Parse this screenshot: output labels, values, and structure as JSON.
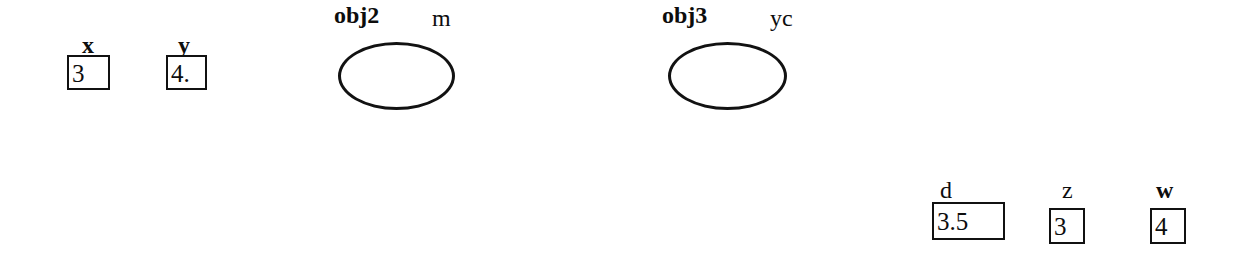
{
  "diagram": {
    "background_color": "#ffffff",
    "stroke_color": "#111111",
    "variables": [
      {
        "name": "x",
        "label": "x",
        "value": "3",
        "box": {
          "x": 67,
          "y": 55,
          "w": 43,
          "h": 35
        },
        "label_pos": {
          "x": 82,
          "y": 33
        }
      },
      {
        "name": "y",
        "label": "y",
        "value": "4.",
        "box": {
          "x": 166,
          "y": 55,
          "w": 41,
          "h": 35
        },
        "label_pos": {
          "x": 178,
          "y": 33
        }
      },
      {
        "name": "d",
        "label": "d",
        "value": "3.5",
        "box": {
          "x": 932,
          "y": 202,
          "w": 73,
          "h": 38
        },
        "label_pos": {
          "x": 940,
          "y": 178
        }
      },
      {
        "name": "z",
        "label": "z",
        "value": "3",
        "box": {
          "x": 1049,
          "y": 208,
          "w": 36,
          "h": 36
        },
        "label_pos": {
          "x": 1062,
          "y": 178
        }
      },
      {
        "name": "w",
        "label": "w",
        "value": "4",
        "box": {
          "x": 1150,
          "y": 208,
          "w": 36,
          "h": 36
        },
        "label_pos": {
          "x": 1156,
          "y": 178
        }
      }
    ],
    "objects": [
      {
        "name": "obj2",
        "id_label": "obj2",
        "type_label": "m",
        "ellipse": {
          "x": 338,
          "y": 42,
          "w": 117,
          "h": 68
        },
        "id_pos": {
          "x": 334,
          "y": 3
        },
        "type_pos": {
          "x": 432,
          "y": 6
        }
      },
      {
        "name": "obj3",
        "id_label": "obj3",
        "type_label": "yc",
        "ellipse": {
          "x": 668,
          "y": 42,
          "w": 119,
          "h": 68
        },
        "id_pos": {
          "x": 662,
          "y": 3
        },
        "type_pos": {
          "x": 770,
          "y": 6
        }
      }
    ]
  }
}
